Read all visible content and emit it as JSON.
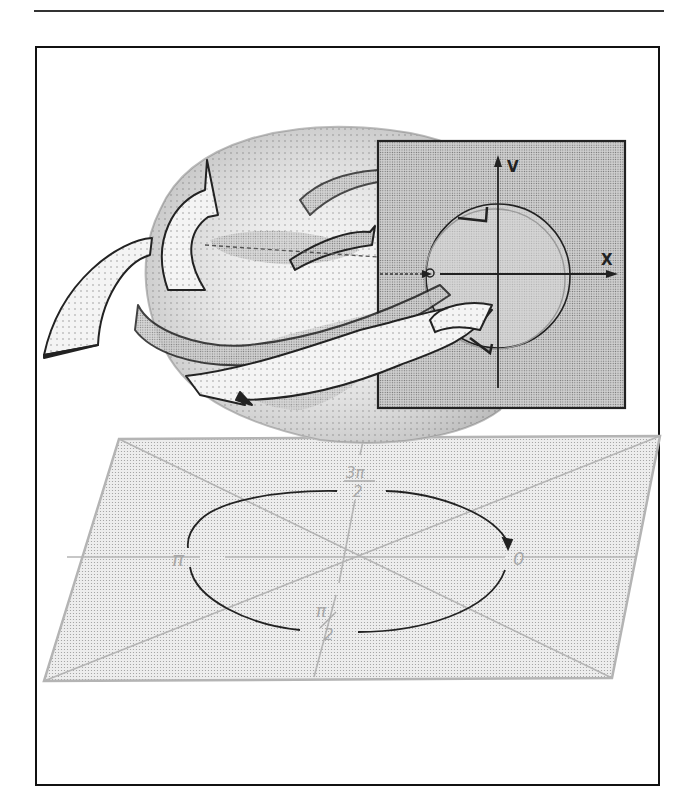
{
  "figure": {
    "inset": {
      "x_axis_label": "X",
      "y_axis_label": "V"
    },
    "plane": {
      "angle_labels": {
        "right": "0",
        "bottom": "π/2",
        "left": "π",
        "top": "3π/2"
      },
      "bottom_label_num": "π",
      "bottom_label_den": "2",
      "top_label_num": "3π",
      "top_label_den": "2"
    },
    "colors": {
      "frame": "#111111",
      "plane_fill": "#e4e4e4",
      "plane_stroke": "#b4b4b4",
      "inset_fill": "#d2d2d2",
      "surface_fill": "#e8e8e8",
      "orbit_stroke": "#222222",
      "label_gray": "#a8a8a8"
    }
  }
}
